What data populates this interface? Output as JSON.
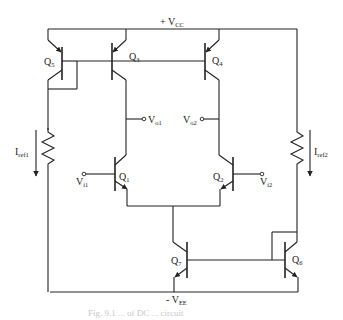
{
  "figure": {
    "supply_top": {
      "sign": "+ ",
      "main": "V",
      "sub": "CC"
    },
    "supply_bottom": {
      "sign": "- ",
      "main": "V",
      "sub": "EE"
    },
    "transistors": [
      {
        "id": "Q1",
        "main": "Q",
        "sub": "1",
        "type": "npn"
      },
      {
        "id": "Q2",
        "main": "Q",
        "sub": "2",
        "type": "npn"
      },
      {
        "id": "Q3",
        "main": "Q",
        "sub": "3",
        "type": "pnp"
      },
      {
        "id": "Q4",
        "main": "Q",
        "sub": "4",
        "type": "pnp"
      },
      {
        "id": "Q5",
        "main": "Q",
        "sub": "5",
        "type": "pnp"
      },
      {
        "id": "Q6",
        "main": "Q",
        "sub": "6",
        "type": "npn"
      },
      {
        "id": "Q7",
        "main": "Q",
        "sub": "7",
        "type": "npn"
      }
    ],
    "terminals": {
      "vo1": {
        "main": "V",
        "sub": "o1"
      },
      "vo2": {
        "main": "V",
        "sub": "o2"
      },
      "vi1": {
        "main": "V",
        "sub": "i1"
      },
      "vi2": {
        "main": "V",
        "sub": "i2"
      }
    },
    "currents": {
      "iref1": {
        "main": "I",
        "sub": "ref1"
      },
      "iref2": {
        "main": "I",
        "sub": "ref2"
      }
    },
    "caption": "Fig. 9.1  ...  of DC ... circuit"
  }
}
